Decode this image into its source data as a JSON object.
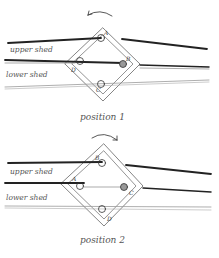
{
  "diagrams": [
    {
      "caption": "position 1",
      "upper_label": "upper shed",
      "lower_label": "lower shed",
      "rotation": "counterclockwise",
      "corners": {
        "top": "A",
        "right": "B",
        "bottom": "C",
        "left": "D"
      }
    },
    {
      "caption": "position 2",
      "upper_label": "upper shed",
      "lower_label": "lower shed",
      "rotation": "clockwise",
      "corners": {
        "top": "B",
        "right": "C",
        "bottom": "D",
        "left": "A"
      }
    }
  ]
}
